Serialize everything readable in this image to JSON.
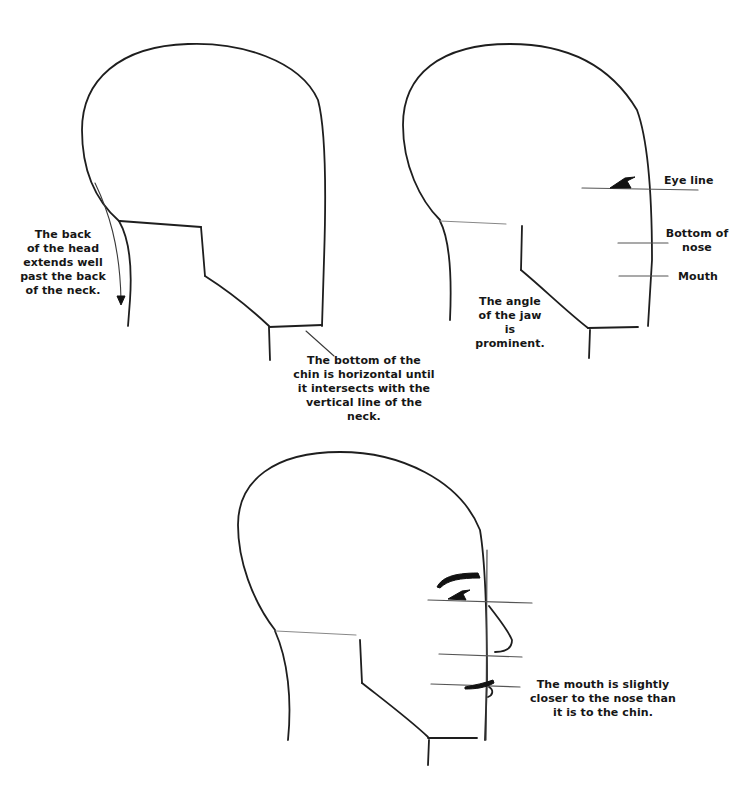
{
  "figures": {
    "head_back_neck": {
      "annotations": {
        "back_of_head": "The back\nof the head\nextends well\npast the back\nof the neck.",
        "chin_bottom": "The bottom of the\nchin is horizontal until\nit intersects with the\nvertical line of the neck."
      }
    },
    "head_proportions": {
      "annotations": {
        "eye_line": "Eye line",
        "bottom_of_nose": "Bottom of\nnose",
        "mouth": "Mouth",
        "jaw_angle": "The angle\nof the jaw is\nprominent."
      }
    },
    "head_features": {
      "annotations": {
        "mouth_position": "The mouth is slightly\ncloser to the nose than\nit is to the chin."
      }
    }
  }
}
